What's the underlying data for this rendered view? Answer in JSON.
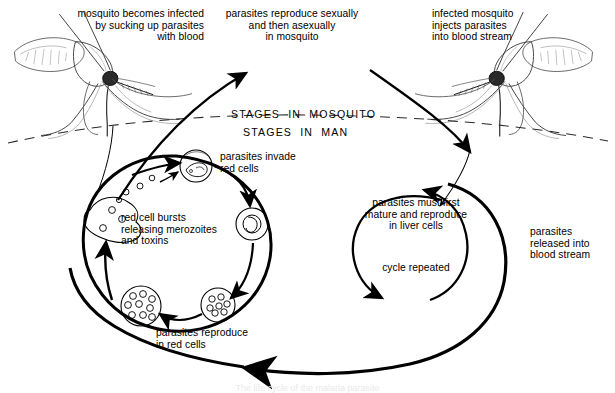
{
  "figure": {
    "title": "The life cycle of the malaria parasite",
    "background_color": "#ffffff",
    "ink_color": "#000000"
  },
  "divider": {
    "above_label": "STAGES  IN  MOSQUITO",
    "below_label": "STAGES  IN  MAN"
  },
  "labels": {
    "mosquito_infected": "mosquito becomes infected\nby sucking up parasites\nwith blood",
    "reproduce_mosquito": "parasites reproduce sexually\nand then asexually\nin mosquito",
    "mosquito_injects": "infected mosquito\ninjects parasites\ninto blood stream",
    "invade_red_cells": "parasites invade\nred cells",
    "red_cell_bursts": "red cell bursts\nreleasing merozoites\nand toxins",
    "reproduce_red_cells": "parasites reproduce\nin red cells",
    "liver_cells": "parasites must first\nmature and reproduce\nin liver cells",
    "cycle_repeated": "cycle repeated",
    "released_blood_stream": "parasites\nreleased into\nblood stream"
  },
  "caption": "The life cycle of the malaria parasite",
  "diagram_data": {
    "type": "cycle-diagram",
    "subject": "malaria parasite life cycle",
    "compartments": [
      {
        "name": "mosquito",
        "position": "above-divider"
      },
      {
        "name": "man",
        "position": "below-divider"
      }
    ],
    "actors": [
      {
        "name": "mosquito-left",
        "role": "mosquito becomes infected by sucking up parasites with blood"
      },
      {
        "name": "mosquito-right",
        "role": "infected mosquito injects parasites into blood stream"
      }
    ],
    "cycles": [
      {
        "name": "erythrocytic-cycle",
        "location": "red cells",
        "stages": [
          "parasites invade red cells",
          "parasites reproduce in red cells",
          "red cell bursts releasing merozoites and toxins"
        ]
      },
      {
        "name": "exo-erythrocytic-cycle",
        "location": "liver cells",
        "stages": [
          "parasites must first mature and reproduce in liver cells",
          "cycle repeated",
          "parasites released into blood stream"
        ]
      }
    ],
    "cell_icons": [
      {
        "name": "invaded-red-cell",
        "parasites": 1
      },
      {
        "name": "trophozoite-red-cell",
        "parasites": 1
      },
      {
        "name": "schizont-red-cell",
        "parasites": 7
      },
      {
        "name": "merozoite-red-cell",
        "parasites": 9
      },
      {
        "name": "bursting-red-cell",
        "parasites": 3
      }
    ]
  }
}
